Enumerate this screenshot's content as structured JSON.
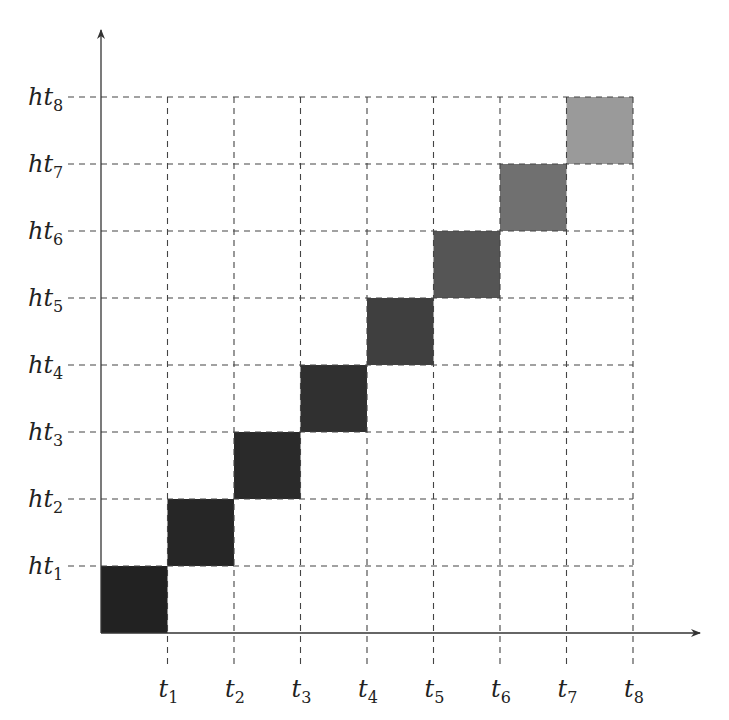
{
  "chart_data": {
    "type": "heatmap",
    "title": "",
    "xlabel": "",
    "ylabel": "",
    "x_tick_labels": [
      "t1",
      "t2",
      "t3",
      "t4",
      "t5",
      "t6",
      "t7",
      "t8"
    ],
    "y_tick_labels": [
      "ht1",
      "ht2",
      "ht3",
      "ht4",
      "ht5",
      "ht6",
      "ht7",
      "ht8"
    ],
    "x_ticks": [
      {
        "base": "t",
        "sub": "1"
      },
      {
        "base": "t",
        "sub": "2"
      },
      {
        "base": "t",
        "sub": "3"
      },
      {
        "base": "t",
        "sub": "4"
      },
      {
        "base": "t",
        "sub": "5"
      },
      {
        "base": "t",
        "sub": "6"
      },
      {
        "base": "t",
        "sub": "7"
      },
      {
        "base": "t",
        "sub": "8"
      }
    ],
    "y_ticks": [
      {
        "base": "ht",
        "sub": "1"
      },
      {
        "base": "ht",
        "sub": "2"
      },
      {
        "base": "ht",
        "sub": "3"
      },
      {
        "base": "ht",
        "sub": "4"
      },
      {
        "base": "ht",
        "sub": "5"
      },
      {
        "base": "ht",
        "sub": "6"
      },
      {
        "base": "ht",
        "sub": "7"
      },
      {
        "base": "ht",
        "sub": "8"
      }
    ],
    "grid": "dashed",
    "cells": [
      {
        "x_from": 0,
        "x_to": 1,
        "y_from": 0,
        "y_to": 1,
        "color": "#222222"
      },
      {
        "x_from": 1,
        "x_to": 2,
        "y_from": 1,
        "y_to": 2,
        "color": "#262626"
      },
      {
        "x_from": 2,
        "x_to": 3,
        "y_from": 2,
        "y_to": 3,
        "color": "#2a2a2a"
      },
      {
        "x_from": 3,
        "x_to": 4,
        "y_from": 3,
        "y_to": 4,
        "color": "#303030"
      },
      {
        "x_from": 4,
        "x_to": 5,
        "y_from": 4,
        "y_to": 5,
        "color": "#3f3f3f"
      },
      {
        "x_from": 5,
        "x_to": 6,
        "y_from": 5,
        "y_to": 6,
        "color": "#555555"
      },
      {
        "x_from": 6,
        "x_to": 7,
        "y_from": 6,
        "y_to": 7,
        "color": "#707070"
      },
      {
        "x_from": 7,
        "x_to": 8,
        "y_from": 7,
        "y_to": 8,
        "color": "#9a9a9a"
      }
    ]
  },
  "colors": {
    "axis": "#333333",
    "grid": "#444444",
    "background": "#ffffff"
  }
}
